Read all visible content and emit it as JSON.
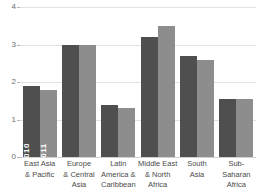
{
  "chart_data": {
    "type": "bar",
    "title": "",
    "subtitle": "",
    "xlabel": "",
    "ylabel": "",
    "ylim": [
      0,
      4
    ],
    "yticks": [
      0,
      1,
      2,
      3,
      4
    ],
    "ytick_labels": [
      "0",
      "1",
      "2",
      "3",
      "4"
    ],
    "grid": true,
    "legend": "in-bar vertical labels on first category",
    "categories": [
      "East Asia\n& Pacific",
      "Europe\n& Central\nAsia",
      "Latin\nAmerica &\nCaribbean",
      "Middle East\n& North\nAfrica",
      "South\nAsia",
      "Sub-Saharan\nAfrica"
    ],
    "category_lines": [
      [
        "East Asia",
        "& Pacific"
      ],
      [
        "Europe",
        "& Central",
        "Asia"
      ],
      [
        "Latin",
        "America &",
        "Caribbean"
      ],
      [
        "Middle East",
        "& North",
        "Africa"
      ],
      [
        "South",
        "Asia"
      ],
      [
        "Sub-Saharan",
        "Africa"
      ]
    ],
    "series": [
      {
        "name": "2010",
        "color": "#4f4f4f",
        "values": [
          1.9,
          3.0,
          1.4,
          3.2,
          2.7,
          1.55
        ]
      },
      {
        "name": "2011",
        "color": "#8d8d8d",
        "values": [
          1.8,
          3.0,
          1.3,
          3.5,
          2.6,
          1.55
        ]
      }
    ],
    "inline_labels": [
      "2010",
      "2011"
    ]
  },
  "colors": {
    "series_2010": "#4f4f4f",
    "series_2011": "#8d8d8d",
    "gridline": "#e2e2e2",
    "baseline": "#d0d0d0",
    "tick_text": "#6d6d6d",
    "category_text": "#4a4a4a",
    "background": "#ffffff"
  }
}
